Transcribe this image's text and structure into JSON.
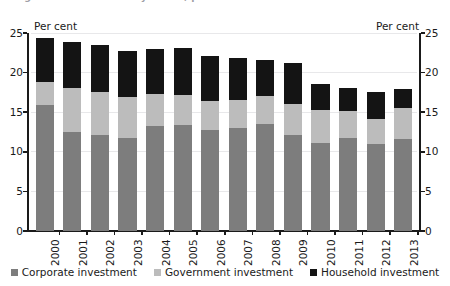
{
  "figure": {
    "title_cutoff": "Figure 1: Investment by sector, per cent of GDP",
    "axis_caption_left": "Per cent",
    "axis_caption_right": "Per cent"
  },
  "legend": {
    "position": "bottom-center",
    "items": [
      {
        "label": "Corporate investment",
        "color": "#7d7d7d",
        "key": "corporate"
      },
      {
        "label": "Government investment",
        "color": "#bcbcbc",
        "key": "government"
      },
      {
        "label": "Household investment",
        "color": "#141414",
        "key": "household"
      }
    ]
  },
  "chart_data": {
    "type": "bar",
    "stacked": true,
    "title": "",
    "xlabel": "",
    "ylabel": "Per cent",
    "ylim": [
      0,
      25
    ],
    "yticks": [
      0,
      5,
      10,
      15,
      20,
      25
    ],
    "ytick_labels": [
      "0",
      "5",
      "10",
      "15",
      "20",
      "25"
    ],
    "grid": true,
    "dual_axis": true,
    "categories": [
      "2000",
      "2001",
      "2002",
      "2003",
      "2004",
      "2005",
      "2006",
      "2007",
      "2008",
      "2009",
      "2010",
      "2011",
      "2012",
      "2013"
    ],
    "series": [
      {
        "name": "Corporate investment",
        "color": "#7d7d7d",
        "values": [
          15.9,
          12.5,
          12.1,
          11.7,
          13.3,
          13.4,
          12.8,
          13.0,
          13.5,
          12.1,
          11.1,
          11.7,
          11.0,
          11.6
        ]
      },
      {
        "name": "Government investment",
        "color": "#bcbcbc",
        "values": [
          2.9,
          5.6,
          5.4,
          5.2,
          4.0,
          3.8,
          3.6,
          3.6,
          3.5,
          3.9,
          4.2,
          3.4,
          3.2,
          3.9
        ]
      },
      {
        "name": "Household investment",
        "color": "#141414",
        "values": [
          5.6,
          5.8,
          6.0,
          5.8,
          5.7,
          5.9,
          5.7,
          5.3,
          4.6,
          5.2,
          3.3,
          2.9,
          3.3,
          2.4
        ]
      }
    ],
    "totals": [
      24.4,
      23.9,
      23.5,
      22.7,
      23.0,
      23.1,
      22.1,
      21.9,
      21.6,
      21.2,
      18.6,
      18.0,
      17.5,
      17.9
    ]
  }
}
